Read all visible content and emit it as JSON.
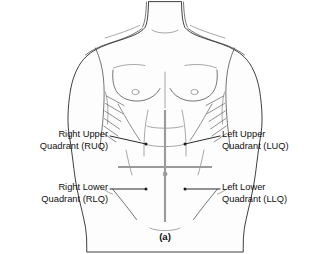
{
  "figure": {
    "caption": "(a)"
  },
  "labels": [
    {
      "id": "ruq",
      "side": "left",
      "line1": "Right Upper",
      "line2": "Quadrant (RUQ)",
      "abbreviation": "RUQ",
      "full_name": "Right Upper Quadrant"
    },
    {
      "id": "rlq",
      "side": "left",
      "line1": "Right Lower",
      "line2": "Quadrant (RLQ)",
      "abbreviation": "RLQ",
      "full_name": "Right Lower Quadrant"
    },
    {
      "id": "luq",
      "side": "right",
      "line1": "Left Upper",
      "line2": "Quadrant (LUQ)",
      "abbreviation": "LUQ",
      "full_name": "Left Upper Quadrant"
    },
    {
      "id": "llq",
      "side": "right",
      "line1": "Left Lower",
      "line2": "Quadrant (LLQ)",
      "abbreviation": "LLQ",
      "full_name": "Left Lower Quadrant"
    }
  ],
  "colors": {
    "background": "#ffffff",
    "outline": "#1d1d1d",
    "detail": "#3a3a3a",
    "divider": "#9a9a9a",
    "text": "#111111",
    "leader": "#1d1d1d"
  },
  "dividers": {
    "vertical_label": "median-plane",
    "horizontal_label": "transumbilical-plane",
    "intersection_label": "umbilicus"
  }
}
